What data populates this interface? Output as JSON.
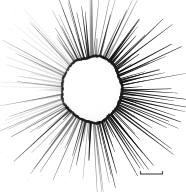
{
  "figure": {
    "background_color": "#ffffff",
    "width": 186,
    "height": 192,
    "specimen_name": "radiolarian-like spiny sphere",
    "scale_bar_caption": ""
  },
  "central_body": {
    "name": "central capsule",
    "center_x": 92,
    "center_y": 89,
    "radius_x": 30,
    "radius_y": 33,
    "outline_color": "#1c1c1c",
    "fill_color": "#fefefe",
    "outline_thickness_px": 1.6,
    "irregularity": 0.045,
    "interior_shading_color": "#f4f4f4"
  },
  "spines": {
    "name": "radiating spines",
    "count": 150,
    "color_dark": "#111111",
    "color_mid": "#5a5a5a",
    "color_faint": "#b8b8b8",
    "min_length_px": 14,
    "max_length_px": 76,
    "base_width_px": 1.35,
    "tip_width_px": 0.18,
    "darkest_sector_deg": [
      300,
      80
    ],
    "faintest_sector_deg": [
      150,
      230
    ]
  },
  "scale_bar": {
    "name": "scale bar",
    "x_start": 140,
    "x_end": 163,
    "y": 174,
    "line_color": "#3f3f3f",
    "line_thickness_px": 1.2,
    "tick_height_px": 3,
    "label": ""
  },
  "speckles": {
    "name": "background speckle noise",
    "count": 90,
    "color": "#dcdcdc"
  }
}
